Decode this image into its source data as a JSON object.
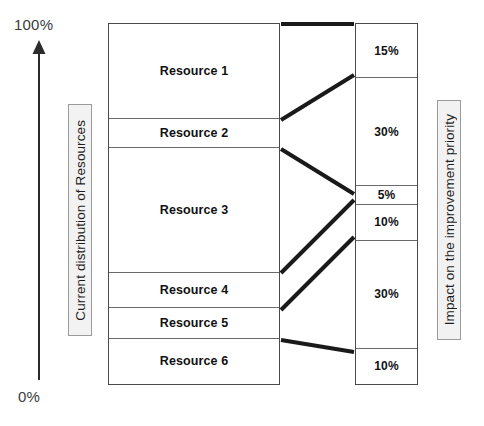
{
  "axis": {
    "top_label": "100%",
    "bottom_label": "0%",
    "arrow_icon": "up-arrow-icon"
  },
  "left_panel": {
    "side_label": "Current distribution of Resources",
    "segments": [
      {
        "label": "Resource 1",
        "share": 26.5
      },
      {
        "label": "Resource 2",
        "share": 8.0
      },
      {
        "label": "Resource 3",
        "share": 34.8
      },
      {
        "label": "Resource 4",
        "share": 9.7
      },
      {
        "label": "Resource 5",
        "share": 8.3
      },
      {
        "label": "Resource 6",
        "share": 12.7
      }
    ]
  },
  "right_panel": {
    "side_label": "Impact on the improvement priority",
    "segments": [
      {
        "label": "15%",
        "value": 15
      },
      {
        "label": "30%",
        "value": 30
      },
      {
        "label": "5%",
        "value": 5
      },
      {
        "label": "10%",
        "value": 10
      },
      {
        "label": "30%",
        "value": 30
      },
      {
        "label": "10%",
        "value": 10
      }
    ]
  },
  "connectors": [
    {
      "from": "Resource 1",
      "to": "15%",
      "x1": 281,
      "y1": 24,
      "x2": 354,
      "y2": 24
    },
    {
      "from": "Resource 2",
      "to": "30%",
      "x1": 281,
      "y1": 120,
      "x2": 354,
      "y2": 75
    },
    {
      "from": "Resource 2",
      "to": "5%",
      "x1": 281,
      "y1": 149,
      "x2": 354,
      "y2": 194
    },
    {
      "from": "Resource 3",
      "to": "10%",
      "x1": 281,
      "y1": 273,
      "x2": 354,
      "y2": 200
    },
    {
      "from": "Resource 4",
      "to": "30%",
      "x1": 281,
      "y1": 310,
      "x2": 354,
      "y2": 237
    },
    {
      "from": "Resource 5",
      "to": "10%",
      "x1": 281,
      "y1": 340,
      "x2": 354,
      "y2": 352
    }
  ],
  "colors": {
    "stroke": "#4a4a4a",
    "divider": "#6a6a6a",
    "connector": "#1a1a1a",
    "label_box_border": "#9a9a9a",
    "label_box_fill": "#f2f2f2",
    "axis_text": "#3b3b3b",
    "background": "#ffffff"
  }
}
